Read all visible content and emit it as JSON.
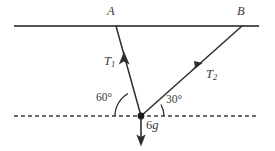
{
  "figure": {
    "canvas": {
      "width": 275,
      "height": 151,
      "background": "#ffffff"
    },
    "colors": {
      "ceiling_line": "#555555",
      "dashed_line": "#3a3a3a",
      "string_line": "#2e2e2e",
      "arrow": "#2e2e2e",
      "label_text": "#3a3a3a",
      "node_dot": "#1c1c1c"
    },
    "geometry": {
      "ceiling": {
        "x1": 14,
        "y1": 26,
        "x2": 259,
        "y2": 26,
        "stroke_width": 2.1
      },
      "horizontal_dashed": {
        "x1": 14,
        "y1": 116,
        "x2": 259,
        "y2": 116,
        "stroke_width": 1.7,
        "dash": "4 3"
      },
      "particle": {
        "x": 141,
        "y": 116,
        "radius": 3.4
      },
      "string_a": {
        "x1": 116,
        "y1": 26,
        "x2": 141,
        "y2": 116,
        "stroke_width": 1.5
      },
      "string_b": {
        "x1": 141,
        "y1": 116,
        "x2": 242,
        "y2": 26,
        "stroke_width": 1.5
      },
      "weight_arrow": {
        "x1": 141,
        "y1": 116,
        "x2": 141,
        "y2": 145,
        "stroke_width": 1.6
      },
      "arc_60": {
        "radius": 26
      },
      "arc_30": {
        "radius": 23
      }
    },
    "labels": {
      "point_a": {
        "text": "A",
        "x": 107,
        "y": 5
      },
      "point_b": {
        "text": "B",
        "x": 237,
        "y": 5
      },
      "tension_1": {
        "text": "T",
        "sub": "1",
        "x": 104,
        "y": 55
      },
      "tension_2": {
        "text": "T",
        "sub": "2",
        "x": 206,
        "y": 68
      },
      "angle_left": {
        "text": "60°",
        "x": 96,
        "y": 92
      },
      "angle_right": {
        "text": "30°",
        "x": 166,
        "y": 94
      },
      "weight": {
        "num": "6",
        "sym": "g",
        "x": 146,
        "y": 119
      }
    },
    "values": {
      "angle_left_degrees": 60,
      "angle_right_degrees": 30,
      "weight_expression": "6g",
      "tension_labels": [
        "T1",
        "T2"
      ],
      "attachment_points": [
        "A",
        "B"
      ]
    }
  }
}
